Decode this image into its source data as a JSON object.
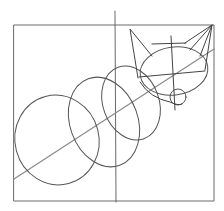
{
  "image": {
    "description": "Pencil construction sketch of a fox using a frame, guideline and overlapping circles",
    "colors": {
      "background": "#ffffff",
      "pencil": "#555555",
      "pencil_light": "#8a8a8a"
    }
  }
}
